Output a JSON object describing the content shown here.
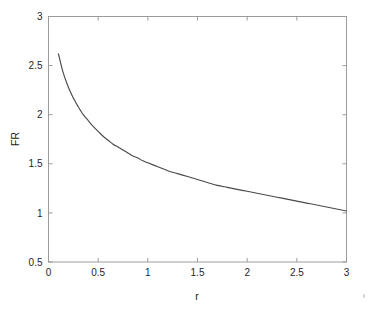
{
  "figure": {
    "background_color": "#ffffff",
    "axes_color": "#9a9a9a",
    "curve_color": "#4a4a4a",
    "text_color": "#262626"
  },
  "chart_data": {
    "type": "line",
    "title": "",
    "xlabel": "r",
    "ylabel": "FR",
    "xlim": [
      0,
      3
    ],
    "ylim": [
      0.5,
      3
    ],
    "xticks": [
      0,
      0.5,
      1,
      1.5,
      2,
      2.5,
      3
    ],
    "xticklabels": [
      "0",
      "0.5",
      "1",
      "1.5",
      "2",
      "2.5",
      "3"
    ],
    "yticks": [
      0.5,
      1,
      1.5,
      2,
      2.5,
      3
    ],
    "yticklabels": [
      "0.5",
      "1",
      "1.5",
      "2",
      "2.5",
      "3"
    ],
    "grid": false,
    "legend": null,
    "series": [
      {
        "name": "FR",
        "x": [
          0.1,
          0.15,
          0.2,
          0.25,
          0.3,
          0.35,
          0.4,
          0.45,
          0.5,
          0.55,
          0.6,
          0.65,
          0.7,
          0.75,
          0.8,
          0.85,
          0.9,
          0.95,
          1.0,
          1.1,
          1.2,
          1.3,
          1.4,
          1.5,
          1.6,
          1.7,
          1.8,
          1.9,
          2.0,
          2.1,
          2.2,
          2.3,
          2.4,
          2.5,
          2.6,
          2.7,
          2.8,
          2.9,
          3.0
        ],
        "values": [
          2.62,
          2.42,
          2.28,
          2.17,
          2.08,
          2.0,
          1.94,
          1.88,
          1.83,
          1.78,
          1.74,
          1.7,
          1.67,
          1.64,
          1.61,
          1.58,
          1.56,
          1.53,
          1.51,
          1.47,
          1.43,
          1.4,
          1.37,
          1.34,
          1.31,
          1.28,
          1.26,
          1.24,
          1.22,
          1.2,
          1.18,
          1.16,
          1.14,
          1.12,
          1.1,
          1.08,
          1.06,
          1.04,
          1.02
        ]
      }
    ]
  }
}
